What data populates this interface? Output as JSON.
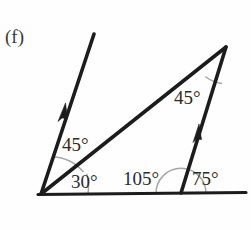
{
  "figure": {
    "part_label": "(f)",
    "background_color": "#fefefe",
    "line_color": "#1c1c1c",
    "arc_color": "#a6a6a6",
    "text_color": "#2b2b2b"
  },
  "angles": [
    {
      "id": "angle-45-left",
      "value": "45°",
      "x": 62,
      "y": 151
    },
    {
      "id": "angle-30",
      "value": "30°",
      "x": 71,
      "y": 188
    },
    {
      "id": "angle-105",
      "value": "105°",
      "x": 123,
      "y": 185
    },
    {
      "id": "angle-75",
      "value": "75°",
      "x": 192,
      "y": 185
    },
    {
      "id": "angle-45-apex",
      "value": "45°",
      "x": 174,
      "y": 104
    }
  ],
  "geometry": {
    "vertex_left": {
      "x": 41,
      "y": 194
    },
    "vertex_right": {
      "x": 181,
      "y": 193
    },
    "apex": {
      "x": 226,
      "y": 47
    },
    "ray_left_tip": {
      "x": 94,
      "y": 34
    },
    "baseline_start": {
      "x": 38,
      "y": 194
    },
    "baseline_end": {
      "x": 246,
      "y": 192
    }
  },
  "arrow_marks": [
    {
      "id": "arrow-left-ray",
      "label": "parallel-mark-arrow"
    },
    {
      "id": "arrow-right-side",
      "label": "parallel-mark-arrow"
    }
  ]
}
